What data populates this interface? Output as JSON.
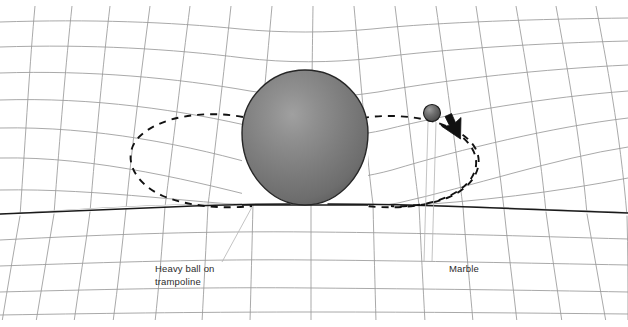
{
  "figure": {
    "background_color": "#ffffff",
    "grid_color": "#9a9a9a",
    "rim_color": "#1a1a1a",
    "dash_color": "#111111",
    "leader_color": "#b0b0b0"
  },
  "objects": {
    "heavy_ball": {
      "name": "heavy ball",
      "center_x": 305,
      "center_y": 133,
      "radius": 63,
      "fill_highlight": "#9a9a9a",
      "fill_mid": "#7d7d7d",
      "fill_edge": "#636363",
      "stroke": "#2a2a2a"
    },
    "marble": {
      "name": "marble",
      "center_x": 432,
      "center_y": 113,
      "radius": 8.5,
      "fill_highlight": "#8d8d8d",
      "fill_edge": "#4a4a4a",
      "stroke": "#1c1c1c"
    },
    "arrow": {
      "name": "direction-of-motion arrow",
      "tip_x": 443,
      "tip_y": 116,
      "fill": "#111111"
    }
  },
  "annotations": {
    "heavy_ball_label": {
      "line1": "Heavy ball on",
      "line2": "trampoline",
      "x": 155,
      "y": 271
    },
    "marble_label": {
      "line1": "Marble",
      "x": 449,
      "y": 272
    }
  },
  "orbit": {
    "type": "dashed ellipse",
    "center_x": 305,
    "center_y": 158,
    "rx": 170,
    "ry": 46,
    "dash_pattern": "7 6"
  }
}
